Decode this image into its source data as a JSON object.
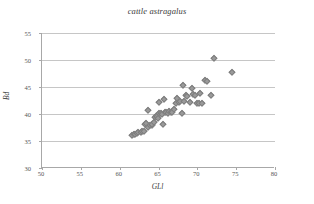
{
  "chart_data": {
    "type": "scatter",
    "title": "cattle astragalus",
    "xlabel": "GLl",
    "ylabel": "Bd",
    "xlim": [
      50,
      80
    ],
    "ylim": [
      30,
      55
    ],
    "xticks": [
      50,
      55,
      60,
      65,
      70,
      75,
      80
    ],
    "yticks": [
      30,
      35,
      40,
      45,
      50,
      55
    ],
    "grid": true,
    "legend": null,
    "marker": "diamond",
    "marker_color": "#9a9a9a",
    "series": [
      {
        "name": "cattle astragalus",
        "points": [
          [
            61.6,
            36.2
          ],
          [
            61.8,
            36.3
          ],
          [
            62.0,
            36.3
          ],
          [
            62.2,
            36.5
          ],
          [
            62.4,
            36.6
          ],
          [
            62.7,
            36.7
          ],
          [
            62.9,
            36.8
          ],
          [
            63.1,
            36.9
          ],
          [
            63.3,
            38.2
          ],
          [
            63.4,
            38.4
          ],
          [
            63.6,
            37.6
          ],
          [
            63.7,
            40.8
          ],
          [
            63.9,
            38.0
          ],
          [
            64.1,
            37.9
          ],
          [
            64.2,
            38.1
          ],
          [
            64.4,
            38.6
          ],
          [
            64.6,
            39.4
          ],
          [
            64.7,
            39.7
          ],
          [
            64.8,
            39.6
          ],
          [
            64.9,
            39.3
          ],
          [
            65.0,
            40.2
          ],
          [
            65.1,
            42.3
          ],
          [
            65.3,
            40.1
          ],
          [
            65.4,
            40.0
          ],
          [
            65.6,
            38.1
          ],
          [
            65.7,
            42.8
          ],
          [
            65.9,
            40.4
          ],
          [
            66.0,
            40.3
          ],
          [
            66.2,
            40.2
          ],
          [
            66.4,
            40.5
          ],
          [
            66.6,
            40.4
          ],
          [
            66.8,
            40.3
          ],
          [
            67.0,
            41.0
          ],
          [
            67.2,
            42.1
          ],
          [
            67.4,
            43.0
          ],
          [
            67.6,
            42.3
          ],
          [
            67.8,
            42.5
          ],
          [
            68.0,
            40.1
          ],
          [
            68.1,
            45.4
          ],
          [
            68.3,
            42.4
          ],
          [
            68.5,
            43.5
          ],
          [
            68.7,
            43.4
          ],
          [
            69.0,
            42.3
          ],
          [
            69.3,
            44.9
          ],
          [
            69.5,
            43.7
          ],
          [
            69.7,
            43.5
          ],
          [
            70.0,
            42.0
          ],
          [
            70.2,
            42.0
          ],
          [
            70.4,
            43.9
          ],
          [
            70.6,
            42.0
          ],
          [
            71.0,
            46.3
          ],
          [
            71.2,
            46.2
          ],
          [
            71.8,
            43.6
          ],
          [
            72.2,
            50.4
          ],
          [
            74.5,
            47.8
          ]
        ]
      }
    ]
  },
  "axis": {
    "y_tick_labels": [
      "30",
      "35",
      "40",
      "45",
      "50",
      "55"
    ],
    "x_tick_labels": [
      "50",
      "55",
      "60",
      "65",
      "70",
      "75",
      "80"
    ]
  }
}
